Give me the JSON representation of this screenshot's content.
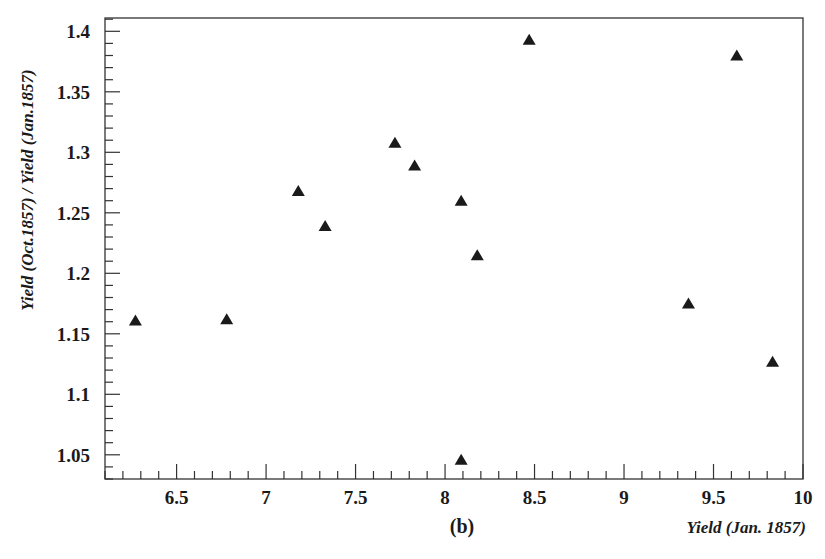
{
  "chart_data": {
    "type": "scatter",
    "title": "",
    "panel_label": "(b)",
    "xlabel": "Yield (Jan. 1857)",
    "ylabel": "Yield (Oct.1857) / Yield (Jan.1857)",
    "xlim": [
      6.1,
      10
    ],
    "ylim": [
      1.03,
      1.411
    ],
    "x_ticks": [
      6.5,
      7,
      7.5,
      8,
      8.5,
      9,
      9.5,
      10
    ],
    "x_tick_labels": [
      "6.5",
      "7",
      "7.5",
      "8",
      "8.5",
      "9",
      "9.5",
      "10"
    ],
    "x_minor_step": 0.1,
    "y_ticks": [
      1.05,
      1.1,
      1.15,
      1.2,
      1.25,
      1.3,
      1.35,
      1.4
    ],
    "y_tick_labels": [
      "1.05",
      "1.1",
      "1.15",
      "1.2",
      "1.25",
      "1.3",
      "1.35",
      "1.4"
    ],
    "y_minor_step": 0.01,
    "grid": false,
    "legend": null,
    "marker": "filled-triangle",
    "marker_color": "#1a1a1a",
    "series": [
      {
        "name": "Yield ratio",
        "points": [
          {
            "x": 6.27,
            "y": 1.161
          },
          {
            "x": 6.78,
            "y": 1.162
          },
          {
            "x": 7.18,
            "y": 1.268
          },
          {
            "x": 7.33,
            "y": 1.239
          },
          {
            "x": 7.72,
            "y": 1.308
          },
          {
            "x": 7.83,
            "y": 1.289
          },
          {
            "x": 8.09,
            "y": 1.26
          },
          {
            "x": 8.18,
            "y": 1.215
          },
          {
            "x": 8.09,
            "y": 1.046
          },
          {
            "x": 8.47,
            "y": 1.393
          },
          {
            "x": 9.36,
            "y": 1.175
          },
          {
            "x": 9.63,
            "y": 1.38
          },
          {
            "x": 9.83,
            "y": 1.127
          }
        ]
      }
    ]
  }
}
